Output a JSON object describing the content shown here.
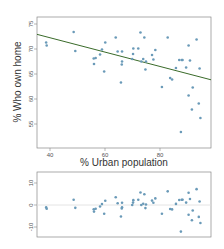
{
  "chart_data": [
    {
      "type": "scatter",
      "title": "",
      "xlabel": "% Urban population",
      "ylabel": "% Who own home",
      "xlim": [
        35,
        99
      ],
      "ylim": [
        50,
        76
      ],
      "xticks": [
        40,
        60,
        80
      ],
      "yticks": [
        55,
        60,
        65,
        70,
        75
      ],
      "grid": false,
      "regression_line": {
        "intercept": 77.9,
        "slope": -0.142,
        "color": "#3a6b2a"
      },
      "point_color": "#6a9ab8",
      "x": [
        38.6,
        38.8,
        48.6,
        49.2,
        55.9,
        56.6,
        56.0,
        58.2,
        58.9,
        60.1,
        59.7,
        63.9,
        64.6,
        66.2,
        66.2,
        66.1,
        65.8,
        70.3,
        70.2,
        69.9,
        72.1,
        72.9,
        74.3,
        73.9,
        73.2,
        74.9,
        74.7,
        77.1,
        78.3,
        77.6,
        82.8,
        80.7,
        83.7,
        84.4,
        85.8,
        87.0,
        87.9,
        88.2,
        87.6,
        89.5,
        90.4,
        90.9,
        90.4,
        91.9,
        91.6,
        93.3,
        94.4,
        94.1,
        94.7
      ],
      "y": [
        71.3,
        70.7,
        73.4,
        69.6,
        68.1,
        68.2,
        67.0,
        68.9,
        69.9,
        71.3,
        65.5,
        72.3,
        69.5,
        69.5,
        67.5,
        66.9,
        63.3,
        70.1,
        69.0,
        68.0,
        70.1,
        73.3,
        72.3,
        68.0,
        67.5,
        67.5,
        65.9,
        68.8,
        69.8,
        67.9,
        72.3,
        62.4,
        64.2,
        63.9,
        66.2,
        67.8,
        67.8,
        67.8,
        53.4,
        66.3,
        70.7,
        67.7,
        60.7,
        62.3,
        57.9,
        71.9,
        66.1,
        59.1,
        56.2
      ]
    },
    {
      "type": "scatter",
      "title": "",
      "xlabel": "",
      "ylabel": "",
      "xlim": [
        35,
        99
      ],
      "ylim": [
        -15,
        15
      ],
      "yticks": [
        -10,
        0,
        10
      ],
      "grid": false,
      "reference_line": {
        "y": 0,
        "color": "#dddddd"
      },
      "point_color": "#6a9ab8",
      "x": [
        38.6,
        38.8,
        48.6,
        49.2,
        55.9,
        56.6,
        56.0,
        58.2,
        58.9,
        60.1,
        59.7,
        63.9,
        64.6,
        66.2,
        66.2,
        66.1,
        65.8,
        70.3,
        70.2,
        69.9,
        72.1,
        72.9,
        74.3,
        73.9,
        73.2,
        74.9,
        74.7,
        77.1,
        78.3,
        77.6,
        82.8,
        80.7,
        83.7,
        84.4,
        85.8,
        87.0,
        87.9,
        88.2,
        87.6,
        89.5,
        90.4,
        90.9,
        90.4,
        91.9,
        91.6,
        93.3,
        94.4,
        94.1,
        94.7
      ],
      "residuals": [
        -1.1,
        -1.7,
        2.4,
        -1.3,
        -1.9,
        -1.7,
        -3.0,
        -0.7,
        0.4,
        1.9,
        -4.0,
        3.5,
        0.8,
        1.0,
        -1.0,
        -1.6,
        -5.2,
        2.2,
        1.1,
        0.0,
        2.4,
        5.7,
        4.9,
        0.6,
        -0.0,
        0.2,
        -1.4,
        2.0,
        3.0,
        1.0,
        6.2,
        -4.0,
        -1.8,
        -2.0,
        0.5,
        2.3,
        2.4,
        2.4,
        -12.1,
        1.1,
        5.6,
        2.7,
        -4.4,
        -2.5,
        -6.9,
        7.2,
        1.6,
        -5.4,
        -8.2
      ]
    }
  ],
  "labels": {
    "x_axis": "% Urban population",
    "y_axis": "% Who own home",
    "xticks": [
      "40",
      "60",
      "80"
    ],
    "yticks_main": [
      "55",
      "60",
      "65",
      "70",
      "75"
    ],
    "yticks_resid": [
      "-10",
      "0",
      "10"
    ]
  }
}
